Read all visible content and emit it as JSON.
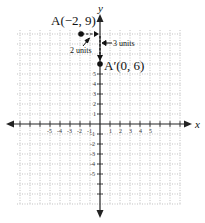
{
  "diagram": {
    "type": "coordinate-plane-translation",
    "axes": {
      "x_label": "x",
      "y_label": "y",
      "x_ticks": [
        "-5",
        "-4",
        "-3",
        "-2",
        "-1",
        "1",
        "2",
        "3",
        "4",
        "5"
      ],
      "y_ticks": [
        "5",
        "4",
        "3",
        "2",
        "1",
        "-1",
        "-2",
        "-3",
        "-4",
        "-5"
      ],
      "grid": "dotted"
    },
    "points": [
      {
        "name": "A",
        "label": "A(−2, 9)",
        "x": -2,
        "y": 9
      },
      {
        "name": "A'",
        "label": "A′(0, 6)",
        "x": 0,
        "y": 6
      }
    ],
    "annotations": {
      "horizontal_shift": "2 units",
      "vertical_shift": "3 units"
    },
    "colors": {
      "axis": "#222222",
      "grid": "#999999",
      "point": "#111111"
    }
  }
}
